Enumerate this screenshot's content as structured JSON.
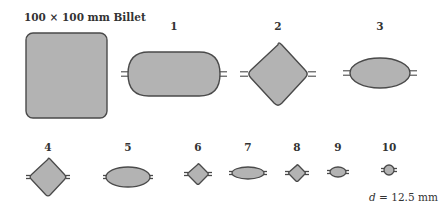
{
  "title": "100 × 100 mm Billet",
  "diameter_label": {
    "symbol": "d",
    "text": " = 12.5 mm"
  },
  "colors": {
    "fill": "#b3b3b3",
    "stroke": "#4a4a4a",
    "background": "#ffffff"
  },
  "billet": {
    "label": "100 × 100 mm Billet",
    "shape": "rounded-square",
    "x": 26,
    "y": 33,
    "w": 81,
    "h": 85
  },
  "passes": [
    {
      "label": "1",
      "shape": "oval-flat",
      "cx": 174,
      "cy": 74,
      "w": 92,
      "h": 44,
      "label_y": 20
    },
    {
      "label": "2",
      "shape": "diamond",
      "cx": 278,
      "cy": 74,
      "w": 62,
      "h": 66,
      "label_y": 20
    },
    {
      "label": "3",
      "shape": "ellipse",
      "cx": 380,
      "cy": 73,
      "w": 60,
      "h": 30,
      "label_y": 20
    },
    {
      "label": "4",
      "shape": "diamond",
      "cx": 48,
      "cy": 177,
      "w": 38,
      "h": 40,
      "label_y": 141
    },
    {
      "label": "5",
      "shape": "ellipse",
      "cx": 128,
      "cy": 177,
      "w": 44,
      "h": 20,
      "label_y": 141
    },
    {
      "label": "6",
      "shape": "diamond",
      "cx": 198,
      "cy": 174,
      "w": 22,
      "h": 22,
      "label_y": 141
    },
    {
      "label": "7",
      "shape": "ellipse",
      "cx": 248,
      "cy": 173,
      "w": 32,
      "h": 12,
      "label_y": 141
    },
    {
      "label": "8",
      "shape": "diamond",
      "cx": 297,
      "cy": 173,
      "w": 18,
      "h": 18,
      "label_y": 141
    },
    {
      "label": "9",
      "shape": "ellipse",
      "cx": 338,
      "cy": 172,
      "w": 16,
      "h": 10,
      "label_y": 141
    },
    {
      "label": "10",
      "shape": "circle",
      "cx": 389,
      "cy": 170,
      "w": 10,
      "h": 10,
      "label_y": 141
    }
  ]
}
